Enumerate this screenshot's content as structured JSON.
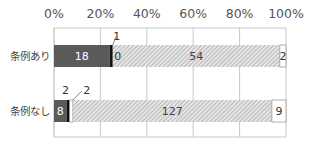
{
  "chart_data": {
    "type": "bar",
    "orientation": "horizontal",
    "stacked": "percent",
    "title": "",
    "xlabel": "",
    "ylabel": "",
    "xlim": [
      0,
      100
    ],
    "x_ticks": [
      "0%",
      "20%",
      "40%",
      "60%",
      "80%",
      "100%"
    ],
    "x_tick_values": [
      0,
      20,
      40,
      60,
      80,
      100
    ],
    "grid": true,
    "legend": "none",
    "categories": [
      "条例あり",
      "条例なし"
    ],
    "series": [
      {
        "name": "segment-1",
        "values": [
          18,
          8
        ],
        "color": "#5a5a5a",
        "pattern": "solid",
        "label_color": "#ffffff"
      },
      {
        "name": "segment-2",
        "values": [
          1,
          2
        ],
        "color": "#111111",
        "pattern": "solid",
        "label_color": "#333333",
        "label_outside": true
      },
      {
        "name": "segment-3",
        "values": [
          0,
          2
        ],
        "color": "#ffffff",
        "pattern": "solid",
        "label_color": "#333333",
        "label_outside_row2": true
      },
      {
        "name": "segment-4",
        "values": [
          54,
          127
        ],
        "color": "#bdbdbd",
        "pattern": "hatch",
        "label_color": "#444444"
      },
      {
        "name": "segment-5",
        "values": [
          2,
          9
        ],
        "color": "#ffffff",
        "pattern": "solid",
        "label_color": "#333333"
      }
    ],
    "totals": [
      75,
      148
    ]
  }
}
